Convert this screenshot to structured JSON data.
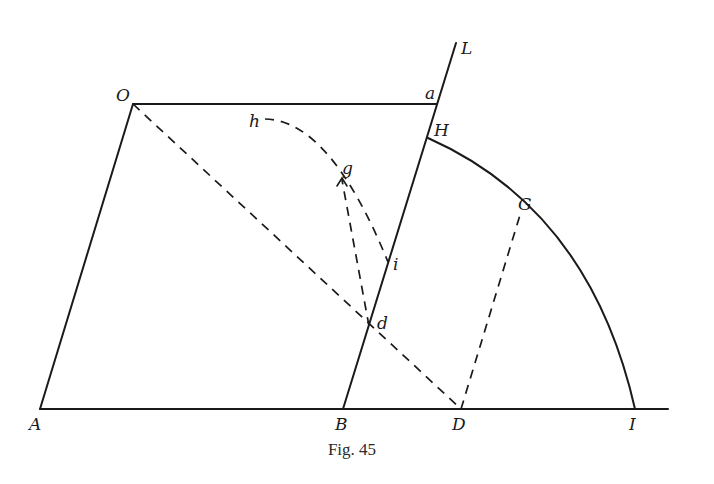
{
  "figure": {
    "caption": "Fig. 45",
    "labels": {
      "O": "O",
      "a": "a",
      "L": "L",
      "H": "H",
      "h": "h",
      "g": "g",
      "G": "G",
      "i": "i",
      "d": "d",
      "A": "A",
      "B": "B",
      "D": "D",
      "I": "I"
    },
    "colors": {
      "ink": "#1a1a1a",
      "background": "#ffffff"
    }
  }
}
